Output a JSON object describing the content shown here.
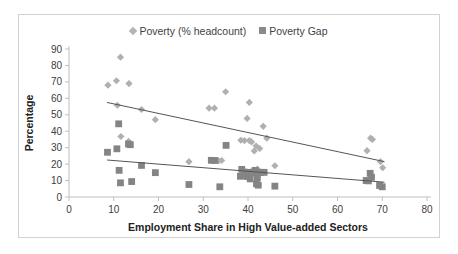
{
  "chart_data": {
    "type": "scatter",
    "title": "",
    "xlabel": "Employment Share in High Value-added Sectors",
    "ylabel": "Percentage",
    "xlim": [
      0,
      80
    ],
    "ylim": [
      0,
      90
    ],
    "xticks": [
      0,
      10,
      20,
      30,
      40,
      50,
      60,
      70,
      80
    ],
    "yticks": [
      0,
      10,
      20,
      30,
      40,
      50,
      60,
      70,
      80,
      90
    ],
    "grid": false,
    "legend_position": "top-center",
    "series": [
      {
        "name": "Poverty (% headcount)",
        "marker": "diamond",
        "color": "#b0b0b0",
        "points": [
          [
            8.7,
            68.0
          ],
          [
            10.6,
            70.7
          ],
          [
            11.5,
            85.0
          ],
          [
            13.4,
            69.0
          ],
          [
            10.8,
            55.8
          ],
          [
            11.6,
            36.8
          ],
          [
            13.3,
            33.8
          ],
          [
            13.6,
            32.2
          ],
          [
            16.2,
            53.2
          ],
          [
            19.3,
            47.0
          ],
          [
            26.8,
            21.5
          ],
          [
            31.3,
            54.0
          ],
          [
            32.5,
            54.0
          ],
          [
            33.4,
            22.0
          ],
          [
            34.1,
            22.2
          ],
          [
            35.0,
            64.0
          ],
          [
            38.4,
            34.5
          ],
          [
            39.2,
            34.3
          ],
          [
            39.8,
            47.8
          ],
          [
            40.3,
            34.3
          ],
          [
            40.3,
            57.5
          ],
          [
            40.8,
            33.5
          ],
          [
            41.4,
            28.0
          ],
          [
            41.8,
            31.0
          ],
          [
            42.1,
            17.0
          ],
          [
            42.4,
            15.5
          ],
          [
            42.6,
            29.5
          ],
          [
            43.4,
            43.0
          ],
          [
            44.2,
            35.8
          ],
          [
            46.0,
            19.0
          ],
          [
            66.6,
            28.2
          ],
          [
            67.4,
            35.8
          ],
          [
            67.8,
            35.0
          ],
          [
            69.6,
            21.5
          ],
          [
            70.1,
            17.8
          ]
        ]
      },
      {
        "name": "Poverty Gap",
        "marker": "square",
        "color": "#848484",
        "points": [
          [
            8.6,
            27.2
          ],
          [
            10.7,
            29.3
          ],
          [
            11.1,
            44.5
          ],
          [
            11.2,
            16.2
          ],
          [
            11.5,
            8.6
          ],
          [
            13.3,
            32.2
          ],
          [
            13.7,
            31.8
          ],
          [
            14.0,
            9.4
          ],
          [
            16.2,
            19.2
          ],
          [
            19.3,
            14.8
          ],
          [
            26.8,
            7.6
          ],
          [
            31.8,
            22.3
          ],
          [
            32.6,
            22.2
          ],
          [
            33.7,
            6.2
          ],
          [
            35.1,
            31.4
          ],
          [
            38.3,
            12.6
          ],
          [
            38.6,
            16.8
          ],
          [
            39.1,
            15.2
          ],
          [
            39.5,
            13.0
          ],
          [
            39.9,
            12.4
          ],
          [
            40.2,
            15.0
          ],
          [
            40.5,
            11.0
          ],
          [
            40.9,
            14.6
          ],
          [
            41.3,
            15.2
          ],
          [
            41.6,
            16.2
          ],
          [
            41.9,
            8.0
          ],
          [
            42.1,
            11.8
          ],
          [
            42.3,
            7.2
          ],
          [
            42.8,
            15.0
          ],
          [
            43.6,
            15.0
          ],
          [
            46.0,
            6.6
          ],
          [
            66.4,
            10.0
          ],
          [
            66.9,
            9.8
          ],
          [
            67.3,
            14.4
          ],
          [
            67.6,
            12.0
          ],
          [
            69.4,
            7.0
          ],
          [
            70.0,
            6.2
          ]
        ]
      }
    ],
    "trendlines": [
      {
        "name": "Poverty (% headcount) trend",
        "series": "Poverty (% headcount)",
        "x_start": 8.5,
        "y_start": 57.5,
        "x_end": 70.5,
        "y_end": 21.5
      },
      {
        "name": "Poverty Gap trend",
        "series": "Poverty Gap",
        "x_start": 8.5,
        "y_start": 22.5,
        "x_end": 70.5,
        "y_end": 9.0
      }
    ]
  },
  "legend": {
    "items": [
      {
        "label": "Poverty (% headcount)",
        "marker": "diamond"
      },
      {
        "label": "Poverty Gap",
        "marker": "square"
      }
    ]
  },
  "axes": {
    "y_title": "Percentage",
    "x_title": "Employment Share in High Value-added Sectors"
  },
  "colors": {
    "diamond": "#b0b0b0",
    "square": "#848484",
    "axis": "#bfbfbf",
    "trendline": "#555555",
    "frame": "#d2d2d2",
    "text": "#222222"
  }
}
